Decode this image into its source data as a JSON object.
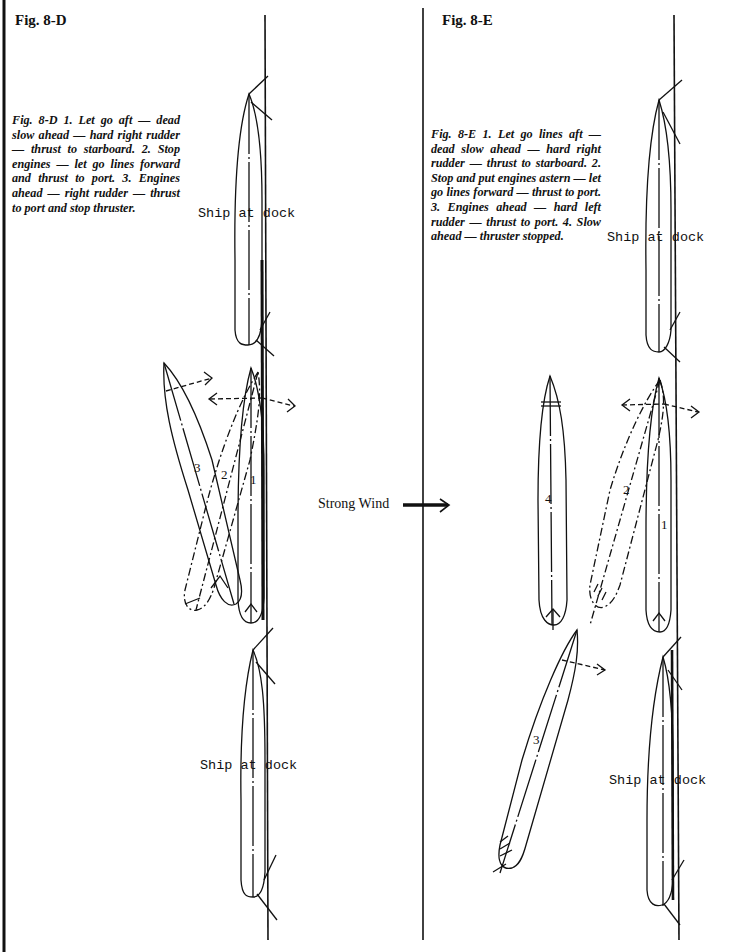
{
  "figures": [
    {
      "id": "8-D",
      "title": "Fig. 8-D",
      "caption": "Fig. 8-D    1. Let go aft — dead slow ahead — hard right rudder — thrust to starboard. 2. Stop engines — let go lines forward and thrust to port. 3. Engines ahead — right rudder — thrust to port and stop thruster.",
      "ship_labels": [
        "Ship at dock",
        "Ship at dock"
      ],
      "position_numbers": [
        "1",
        "2",
        "3"
      ]
    },
    {
      "id": "8-E",
      "title": "Fig. 8-E",
      "caption": "Fig. 8-E    1. Let go lines aft — dead slow ahead — hard right rudder — thrust to starboard. 2. Stop and put engines astern — let go lines forward — thrust to port. 3. Engines ahead — hard left rudder — thrust to port. 4. Slow ahead — thruster stopped.",
      "ship_labels": [
        "Ship at dock",
        "Ship at dock"
      ],
      "position_numbers": [
        "1",
        "2",
        "3",
        "4"
      ]
    }
  ],
  "wind": {
    "label": "Strong Wind",
    "direction": "right-arrow-icon"
  },
  "colors": {
    "ink": "#111111",
    "background": "#ffffff"
  }
}
